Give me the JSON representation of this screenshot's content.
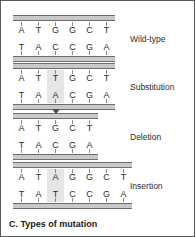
{
  "figure": {
    "caption": "C. Types of mutation",
    "border_color": "#58585a",
    "background": "#ffffff",
    "backbone_color": "#c9c9c9",
    "backbone_line_color": "#6d6d6d",
    "highlight_color": "#e6e6e6",
    "letter_color": "#2b2b2b"
  },
  "panels": [
    {
      "id": "wild-type",
      "label": "Wild-type",
      "top_strand": [
        "A",
        "T",
        "G",
        "G",
        "C",
        "T"
      ],
      "bottom_strand": [
        "T",
        "A",
        "C",
        "C",
        "G",
        "A"
      ],
      "highlight_index": null,
      "marker_index": null,
      "marker_icon": null
    },
    {
      "id": "substitution",
      "label": "Substitution",
      "top_strand": [
        "A",
        "T",
        "T",
        "G",
        "C",
        "T"
      ],
      "bottom_strand": [
        "T",
        "A",
        "A",
        "C",
        "G",
        "A"
      ],
      "highlight_index": 2,
      "marker_index": null,
      "marker_icon": null
    },
    {
      "id": "deletion",
      "label": "Deletion",
      "top_strand": [
        "A",
        "T",
        "G",
        "C",
        "T"
      ],
      "bottom_strand": [
        "T",
        "A",
        "C",
        "G",
        "A"
      ],
      "highlight_index": null,
      "marker_index": 2,
      "marker_icon": "down-triangle-marker"
    },
    {
      "id": "insertion",
      "label": "Insertion",
      "top_strand": [
        "A",
        "T",
        "A",
        "G",
        "G",
        "C",
        "T"
      ],
      "bottom_strand": [
        "T",
        "A",
        "T",
        "C",
        "C",
        "G",
        "A"
      ],
      "highlight_index": 2,
      "marker_index": null,
      "marker_icon": null
    }
  ]
}
